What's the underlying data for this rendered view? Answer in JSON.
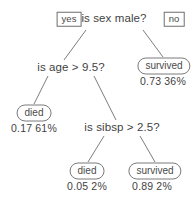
{
  "diagram": {
    "stroke_color": "#6e6e6e",
    "text_color": "#3f3f3f",
    "background": "#ffffff"
  },
  "edge_labels": {
    "yes": "yes",
    "no": "no"
  },
  "nodes": {
    "root": {
      "label": "is sex male?"
    },
    "age_split": {
      "label": "is age > 9.5?"
    },
    "sibsp_split": {
      "label": "is sibsp > 2.5?"
    },
    "survived_right": {
      "label": "survived",
      "prob": "0.73",
      "percent": "36%"
    },
    "died_left": {
      "label": "died",
      "prob": "0.17",
      "percent": "61%"
    },
    "died_bottom": {
      "label": "died",
      "prob": "0.05",
      "percent": "2%"
    },
    "survived_bottom": {
      "label": "survived",
      "prob": "0.89",
      "percent": "2%"
    }
  }
}
